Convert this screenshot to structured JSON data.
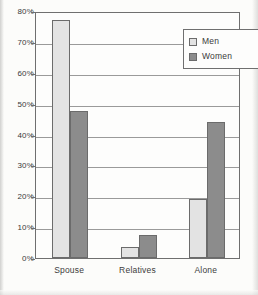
{
  "chart_data": {
    "type": "bar",
    "title": "",
    "xlabel": "",
    "ylabel": "",
    "ylim": [
      0,
      80
    ],
    "grid": true,
    "legend_position": "top-right",
    "categories": [
      "Spouse",
      "Relatives",
      "Alone"
    ],
    "ytick_labels": [
      "0%",
      "10%",
      "20%",
      "30%",
      "40%",
      "50%",
      "60%",
      "70%",
      "80%"
    ],
    "ytick_values": [
      0,
      10,
      20,
      30,
      40,
      50,
      60,
      70,
      80
    ],
    "series": [
      {
        "name": "Men",
        "color": "#e3e3e3",
        "values": [
          77,
          3.5,
          19
        ]
      },
      {
        "name": "Women",
        "color": "#8c8c8c",
        "values": [
          47.5,
          7.5,
          44
        ]
      }
    ]
  },
  "legend": {
    "items": [
      {
        "label": "Men"
      },
      {
        "label": "Women"
      }
    ]
  },
  "colors": {
    "men_fill": "#e3e3e3",
    "women_fill": "#8c8c8c",
    "axis": "#6f6f6f",
    "grid": "#9a9a9a",
    "background": "#fcfcfa"
  }
}
